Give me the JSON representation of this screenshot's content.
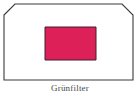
{
  "figure": {
    "caption": "Grünfilter",
    "frame": {
      "name": "chamfered-outline",
      "stroke_color": "#3a3a3a",
      "fill_color": "#ffffff",
      "stroke_width": 1,
      "left": 4,
      "top": 4,
      "right": 133,
      "bottom": 80,
      "chamfer": 11,
      "chamfered_corners": "top-left, top-right"
    },
    "swatch": {
      "name": "color-swatch",
      "fill_color": "#dd2158",
      "stroke_color": "#3a2030",
      "left": 45,
      "top": 27,
      "width": 51,
      "height": 33
    }
  }
}
